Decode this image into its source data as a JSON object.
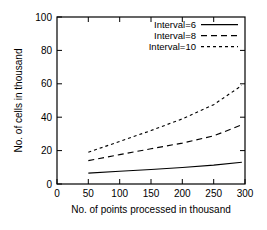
{
  "chart_data": {
    "type": "line",
    "title": "",
    "xlabel": "No. of points processed in thousand",
    "ylabel": "No. of cells in thousand",
    "xlim": [
      0,
      300
    ],
    "ylim": [
      0,
      100
    ],
    "xticks": [
      0,
      50,
      100,
      150,
      200,
      250,
      300
    ],
    "yticks": [
      0,
      20,
      40,
      60,
      80,
      100
    ],
    "xtick_labels": [
      "0",
      "50",
      "100",
      "150",
      "200",
      "250",
      "300"
    ],
    "ytick_labels": [
      "0",
      "20",
      "40",
      "60",
      "80",
      "100"
    ],
    "grid": false,
    "legend_position": "top-right",
    "x": [
      50,
      100,
      150,
      200,
      250,
      295
    ],
    "series": [
      {
        "name": "Interval=6",
        "label": "Interval=6",
        "style": "solid",
        "color": "#000000",
        "values": [
          6.5,
          7.6,
          8.7,
          9.9,
          11.3,
          13.0
        ]
      },
      {
        "name": "Interval=8",
        "label": "Interval=8",
        "style": "dashed",
        "color": "#000000",
        "values": [
          14.0,
          17.6,
          21.1,
          24.5,
          28.8,
          35.5
        ]
      },
      {
        "name": "Interval=10",
        "label": "Interval=10",
        "style": "dotted",
        "color": "#000000",
        "values": [
          19.0,
          25.5,
          32.0,
          39.0,
          47.5,
          59.0
        ]
      }
    ]
  },
  "axes": {
    "x_axis_label": "No. of points processed in thousand",
    "y_axis_label": "No. of cells in thousand"
  },
  "legend": {
    "entries": [
      {
        "label": "Interval=6"
      },
      {
        "label": "Interval=8"
      },
      {
        "label": "Interval=10"
      }
    ]
  }
}
